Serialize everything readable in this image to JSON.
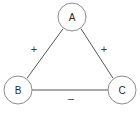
{
  "diagram": {
    "type": "signed-triangle-graph",
    "background_color": "#ffffff",
    "node_stroke_color": "#8c8c8c",
    "node_fill_color": "#ffffff",
    "edge_color": "#555555",
    "label_color": "#2b2b2b",
    "nodes": [
      {
        "id": "A",
        "label": "A",
        "cx": 72,
        "cy": 17,
        "r": 14
      },
      {
        "id": "B",
        "label": "B",
        "cx": 18,
        "cy": 90,
        "r": 14
      },
      {
        "id": "C",
        "label": "C",
        "cx": 122,
        "cy": 90,
        "r": 14
      }
    ],
    "edges": [
      {
        "id": "AB",
        "from": "A",
        "to": "B",
        "sign": "+",
        "label_x": 34,
        "label_y": 49
      },
      {
        "id": "AC",
        "from": "A",
        "to": "C",
        "sign": "+",
        "label_x": 104,
        "label_y": 49
      },
      {
        "id": "BC",
        "from": "B",
        "to": "C",
        "sign": "–",
        "label_x": 71,
        "label_y": 98
      }
    ]
  }
}
